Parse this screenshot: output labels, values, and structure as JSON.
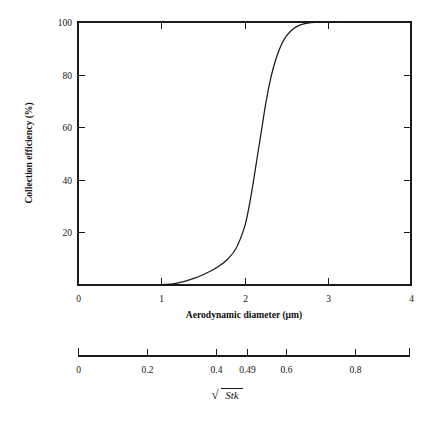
{
  "chart_data": {
    "type": "line",
    "title": "",
    "xlabel": "Aerodynamic diameter (μm)",
    "ylabel": "Collection efficiency (%)",
    "xlim": [
      0,
      4
    ],
    "ylim": [
      0,
      100
    ],
    "grid": false,
    "legend": null,
    "xticks": [
      "0",
      "1",
      "2",
      "3",
      "4"
    ],
    "xtick_values": [
      0,
      1,
      2,
      3,
      4
    ],
    "yticks": [
      "20",
      "40",
      "60",
      "80",
      "100"
    ],
    "ytick_values": [
      20,
      40,
      60,
      80,
      100
    ],
    "secondary_axis": {
      "label_radical": "√",
      "label_symbol": "Stk",
      "ticks": [
        "0",
        "0.2",
        "0.4",
        "0.49",
        "0.6",
        "0.8"
      ],
      "tick_values": [
        0,
        0.2,
        0.4,
        0.49,
        0.6,
        0.8
      ],
      "range": [
        0,
        0.96
      ]
    },
    "series": [
      {
        "name": "Collection efficiency",
        "x": [
          0.0,
          0.5,
          0.9,
          1.0,
          1.1,
          1.15,
          1.2,
          1.3,
          1.4,
          1.5,
          1.6,
          1.7,
          1.8,
          1.9,
          2.0,
          2.05,
          2.1,
          2.15,
          2.2,
          2.25,
          2.3,
          2.35,
          2.4,
          2.45,
          2.5,
          2.55,
          2.6,
          2.65,
          2.7,
          2.8,
          3.0,
          3.4,
          4.0
        ],
        "y": [
          0.0,
          0.0,
          0.0,
          0.1,
          0.3,
          0.5,
          0.8,
          1.6,
          2.6,
          3.9,
          5.4,
          7.3,
          9.9,
          14.0,
          22.0,
          29.0,
          38.0,
          48.0,
          58.0,
          68.0,
          76.5,
          83.0,
          88.0,
          91.8,
          94.5,
          96.4,
          97.7,
          98.6,
          99.2,
          99.8,
          100.0,
          100.0,
          100.0
        ]
      }
    ]
  },
  "labels": {
    "xaxis_title": "Aerodynamic diameter (μm)",
    "yaxis_title": "Collection efficiency (%)",
    "stk_radical": "√",
    "stk_symbol": "Stk"
  },
  "colors": {
    "ink": "#1a1a1a",
    "background": "#ffffff"
  }
}
